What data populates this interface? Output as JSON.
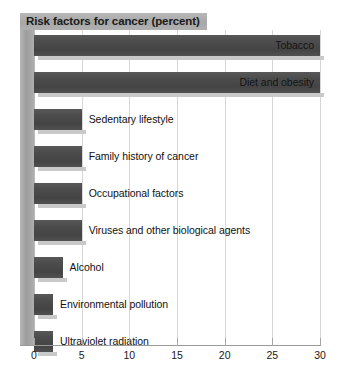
{
  "chart_data": {
    "type": "bar",
    "orientation": "horizontal",
    "title": "Risk factors for cancer (percent)",
    "xlabel": "",
    "ylabel": "",
    "xlim": [
      0,
      30
    ],
    "xticks": [
      "0",
      "5",
      "10",
      "15",
      "20",
      "25",
      "30"
    ],
    "grid": true,
    "legend": "none",
    "bar_color": "#4c4c4c",
    "title_background": "#ababab",
    "categories": [
      "Tobacco",
      "Diet and obesity",
      "Sedentary lifestyle",
      "Family history of cancer",
      "Occupational factors",
      "Viruses and other biological agents",
      "Alcohol",
      "Environmental pollution",
      "Ultraviolet radiation"
    ],
    "values": [
      30,
      30,
      5,
      5,
      5,
      5,
      3,
      2,
      2
    ],
    "bars": [
      {
        "label": "Tobacco",
        "value": 30,
        "label_inside": true
      },
      {
        "label": "Diet and obesity",
        "value": 30,
        "label_inside": true
      },
      {
        "label": "Sedentary lifestyle",
        "value": 5,
        "label_inside": false
      },
      {
        "label": "Family history of cancer",
        "value": 5,
        "label_inside": false
      },
      {
        "label": "Occupational factors",
        "value": 5,
        "label_inside": false
      },
      {
        "label": "Viruses and other biological agents",
        "value": 5,
        "label_inside": false
      },
      {
        "label": "Alcohol",
        "value": 3,
        "label_inside": false
      },
      {
        "label": "Environmental pollution",
        "value": 2,
        "label_inside": false
      },
      {
        "label": "Ultraviolet radiation",
        "value": 2,
        "label_inside": false
      }
    ]
  }
}
